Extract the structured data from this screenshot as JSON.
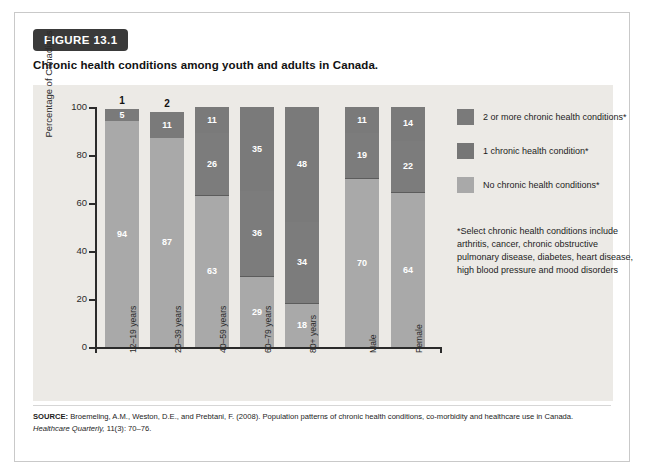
{
  "figure": {
    "badge": "FIGURE 13.1",
    "title": "Chronic health conditions among youth and adults in Canada."
  },
  "source": {
    "label": "SOURCE:",
    "text_part1": " Broemeling, A.M., Weston, D.E., and Prebtani, F. (2008). Population patterns of chronic health conditions, co-morbidity and healthcare use in Canada. ",
    "journal": "Healthcare Quarterly,",
    "text_part2": " 11(3): 70–76."
  },
  "legend": {
    "items": [
      {
        "label": "2 or more chronic health conditions*",
        "color": "#7a7a7a",
        "key": "two"
      },
      {
        "label": "1 chronic health condition*",
        "color": "#767676",
        "key": "one"
      },
      {
        "label": "No chronic health conditions*",
        "color": "#a9a9a9",
        "key": "none"
      }
    ],
    "footnote": "*Select chronic health conditions include arthritis, cancer, chronic obstructive pulmonary disease, diabetes, heart disease, high blood pressure and mood disorders"
  },
  "annotations": [
    {
      "text": "1",
      "category": "12–19 years"
    },
    {
      "text": "2",
      "category": "20–39 years"
    }
  ],
  "chart_data": {
    "type": "bar",
    "stacked": true,
    "title": "Chronic health conditions among youth and adults in Canada.",
    "xlabel": "",
    "ylabel": "Percentage of Canadians",
    "ylim": [
      0,
      100
    ],
    "yticks": [
      0,
      20,
      40,
      60,
      80,
      100
    ],
    "grid": false,
    "legend_position": "right",
    "categories": [
      "12–19 years",
      "20–39 years",
      "40–59 years",
      "60–79 years",
      "80+ years",
      "Male",
      "Female"
    ],
    "series": [
      {
        "name": "No chronic health conditions*",
        "color": "#a9a9a9",
        "values": [
          94,
          87,
          63,
          29,
          18,
          70,
          64
        ]
      },
      {
        "name": "1 chronic health condition*",
        "color": "#767676",
        "values": [
          null,
          null,
          26,
          36,
          34,
          19,
          22
        ]
      },
      {
        "name": "2 or more chronic health conditions*",
        "color": "#7a7a7a",
        "values": [
          5,
          11,
          11,
          35,
          48,
          11,
          14
        ]
      }
    ]
  }
}
